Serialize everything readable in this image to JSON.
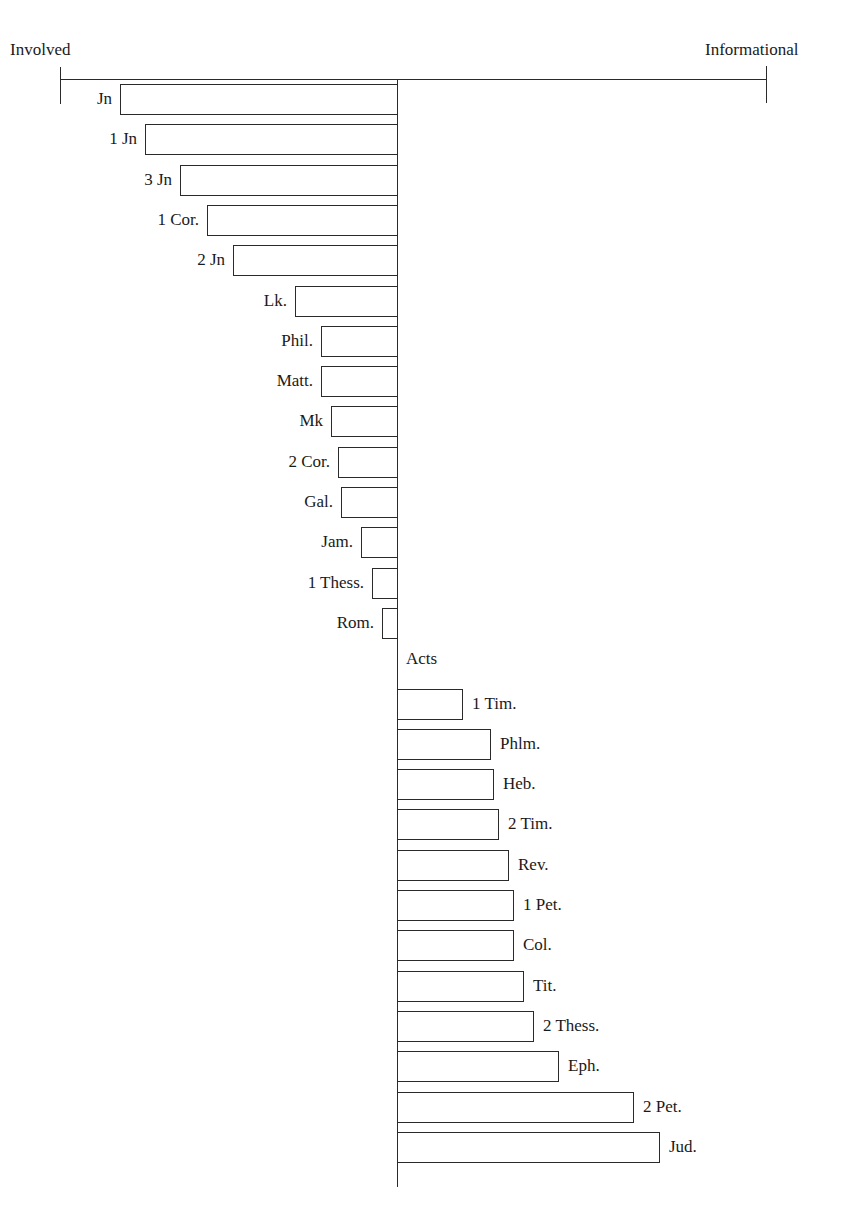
{
  "chart_data": {
    "type": "bar",
    "orientation": "horizontal",
    "title": "",
    "xlabel": "",
    "ylabel": "",
    "axis_poles": {
      "left": "Involved",
      "right": "Informational"
    },
    "xlim": [
      -337,
      369
    ],
    "units": "relative score (pixel offset from center; negative = Involved, positive = Informational)",
    "grid": false,
    "legend": null,
    "categories": [
      "Jn",
      "1 Jn",
      "3 Jn",
      "1 Cor.",
      "2 Jn",
      "Lk.",
      "Phil.",
      "Matt.",
      "Mk",
      "2 Cor.",
      "Gal.",
      "Jam.",
      "1 Thess.",
      "Rom.",
      "Acts",
      "1 Tim.",
      "Phlm.",
      "Heb.",
      "2 Tim.",
      "Rev.",
      "1 Pet.",
      "Col.",
      "Tit.",
      "2 Thess.",
      "Eph.",
      "2 Pet.",
      "Jud."
    ],
    "values": [
      -277,
      -252,
      -217,
      -190,
      -164,
      -102,
      -76,
      -76,
      -66,
      -59,
      -56,
      -36,
      -25,
      -15,
      0,
      66,
      94,
      97,
      102,
      112,
      117,
      117,
      127,
      137,
      162,
      237,
      263
    ]
  },
  "labels": {
    "left_pole": "Involved",
    "right_pole": "Informational"
  },
  "colors": {
    "ink": "#2a2a2a",
    "bar_fill": "#ffffff",
    "background": "#ffffff"
  }
}
